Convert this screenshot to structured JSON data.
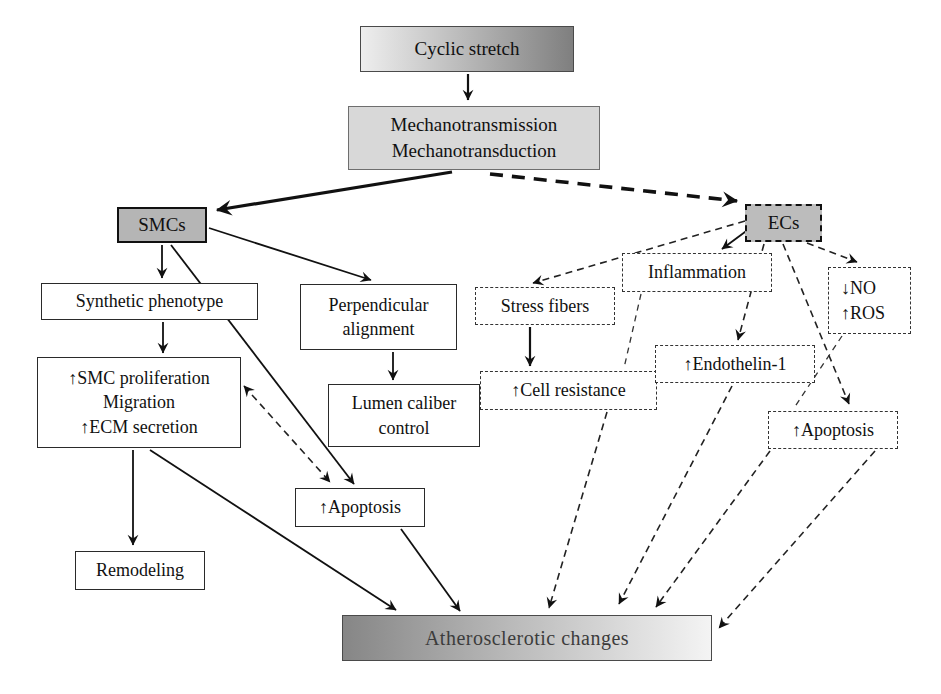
{
  "figure": {
    "type": "flowchart",
    "background": "#ffffff",
    "colors": {
      "gray_node_fill": "#b5b5b5",
      "mechano_fill": "#d8d8d8",
      "gradient_dark": "#868686",
      "gradient_light": "#f4f4f4",
      "line_color": "#111111",
      "box_border": "#2a2a2a"
    }
  },
  "nodes": {
    "cyclic_stretch": {
      "label": "Cyclic stretch"
    },
    "mechanotransduction": {
      "label": "Mechanotransmission\nMechanotransduction"
    },
    "smcs": {
      "label": "SMCs"
    },
    "ecs": {
      "label": "ECs"
    },
    "synthetic_phenotype": {
      "label": "Synthetic phenotype"
    },
    "perpendicular_alignment": {
      "label": "Perpendicular\nalignment"
    },
    "stress_fibers": {
      "label": "Stress fibers"
    },
    "inflammation": {
      "label": "Inflammation"
    },
    "no_ros": {
      "label": "↓NO\n↑ROS"
    },
    "smc_proliferation": {
      "label": "↑SMC proliferation\nMigration\n↑ECM secretion"
    },
    "lumen_caliber": {
      "label": "Lumen caliber\ncontrol"
    },
    "cell_resistance": {
      "label": "↑Cell resistance"
    },
    "endothelin_1": {
      "label": "↑Endothelin-1"
    },
    "apoptosis_ec": {
      "label": "↑Apoptosis"
    },
    "apoptosis_smc": {
      "label": "↑Apoptosis"
    },
    "remodeling": {
      "label": "Remodeling"
    },
    "atherosclerotic_changes": {
      "label": "Atherosclerotic changes"
    }
  },
  "edges": [
    {
      "from": "cyclic_stretch",
      "to": "mechanotransduction",
      "line": "solid",
      "arrowheads": "end"
    },
    {
      "from": "mechanotransduction",
      "to": "smcs",
      "line": "solid-thick",
      "arrowheads": "end"
    },
    {
      "from": "mechanotransduction",
      "to": "ecs",
      "line": "dashed-thick",
      "arrowheads": "end"
    },
    {
      "from": "smcs",
      "to": "synthetic_phenotype",
      "line": "solid",
      "arrowheads": "end"
    },
    {
      "from": "smcs",
      "to": "perpendicular_alignment",
      "line": "solid",
      "arrowheads": "end"
    },
    {
      "from": "smcs",
      "to": "apoptosis_smc",
      "line": "solid",
      "arrowheads": "end"
    },
    {
      "from": "synthetic_phenotype",
      "to": "smc_proliferation",
      "line": "solid",
      "arrowheads": "end"
    },
    {
      "from": "smc_proliferation",
      "to": "apoptosis_smc",
      "line": "dashed",
      "arrowheads": "both"
    },
    {
      "from": "perpendicular_alignment",
      "to": "lumen_caliber",
      "line": "solid",
      "arrowheads": "end"
    },
    {
      "from": "stress_fibers",
      "to": "cell_resistance",
      "line": "solid",
      "arrowheads": "end"
    },
    {
      "from": "smc_proliferation",
      "to": "remodeling",
      "line": "solid",
      "arrowheads": "end"
    },
    {
      "from": "smc_proliferation",
      "to": "atherosclerotic_changes",
      "line": "solid",
      "arrowheads": "end"
    },
    {
      "from": "apoptosis_smc",
      "to": "atherosclerotic_changes",
      "line": "solid",
      "arrowheads": "end"
    },
    {
      "from": "ecs",
      "to": "stress_fibers",
      "line": "dashed",
      "arrowheads": "end"
    },
    {
      "from": "ecs",
      "to": "inflammation",
      "line": "solid",
      "arrowheads": "end"
    },
    {
      "from": "ecs",
      "to": "no_ros",
      "line": "dashed",
      "arrowheads": "end"
    },
    {
      "from": "ecs",
      "to": "endothelin_1",
      "line": "dashed",
      "arrowheads": "end"
    },
    {
      "from": "ecs",
      "to": "apoptosis_ec",
      "line": "dashed",
      "arrowheads": "end"
    },
    {
      "from": "inflammation",
      "to": "cell_resistance",
      "line": "dashed",
      "arrowheads": "none"
    },
    {
      "from": "no_ros",
      "to": "apoptosis_ec",
      "line": "dashed",
      "arrowheads": "none"
    },
    {
      "from": "cell_resistance",
      "to": "atherosclerotic_changes",
      "line": "dashed",
      "arrowheads": "end"
    },
    {
      "from": "endothelin_1",
      "to": "atherosclerotic_changes",
      "line": "dashed",
      "arrowheads": "end"
    },
    {
      "from": "apoptosis_ec",
      "to": "atherosclerotic_changes",
      "line": "dashed",
      "arrowheads": "end"
    },
    {
      "from": "apoptosis_ec",
      "to": "atherosclerotic_changes_right_end",
      "line": "dashed",
      "arrowheads": "end"
    }
  ]
}
